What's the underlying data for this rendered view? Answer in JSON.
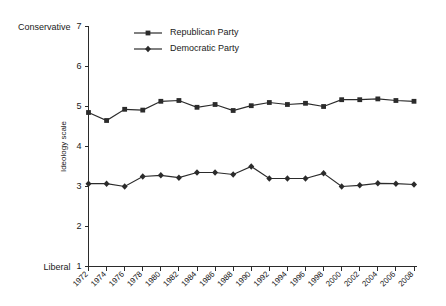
{
  "chart_data": {
    "type": "line",
    "title": "",
    "xlabel": "",
    "ylabel": "Ideology scale",
    "ylim": [
      1,
      7
    ],
    "yticks": [
      1,
      2,
      3,
      4,
      5,
      6,
      7
    ],
    "ytick_labels": [
      "1",
      "2",
      "3",
      "4",
      "5",
      "6",
      "7"
    ],
    "y_axis_top_anchor": "Conservative",
    "y_axis_bottom_anchor": "Liberal",
    "grid": false,
    "legend_position": "top-left-inside",
    "categories": [
      "1972",
      "1974",
      "1976",
      "1978",
      "1980",
      "1982",
      "1984",
      "1986",
      "1988",
      "1990",
      "1992",
      "1994",
      "1996",
      "1998",
      "2000",
      "2002",
      "2004",
      "2006",
      "2008"
    ],
    "series": [
      {
        "name": "Republican Party",
        "marker": "square",
        "color": "#2b2b2b",
        "values": [
          4.85,
          4.65,
          4.93,
          4.91,
          5.13,
          5.15,
          4.98,
          5.05,
          4.9,
          5.02,
          5.1,
          5.05,
          5.08,
          5.0,
          5.17,
          5.17,
          5.19,
          5.15,
          5.13
        ]
      },
      {
        "name": "Democratic Party",
        "marker": "diamond",
        "color": "#2b2b2b",
        "values": [
          3.07,
          3.07,
          3.0,
          3.25,
          3.28,
          3.22,
          3.35,
          3.35,
          3.3,
          3.5,
          3.2,
          3.2,
          3.2,
          3.33,
          3.0,
          3.03,
          3.08,
          3.07,
          3.05
        ]
      }
    ]
  }
}
